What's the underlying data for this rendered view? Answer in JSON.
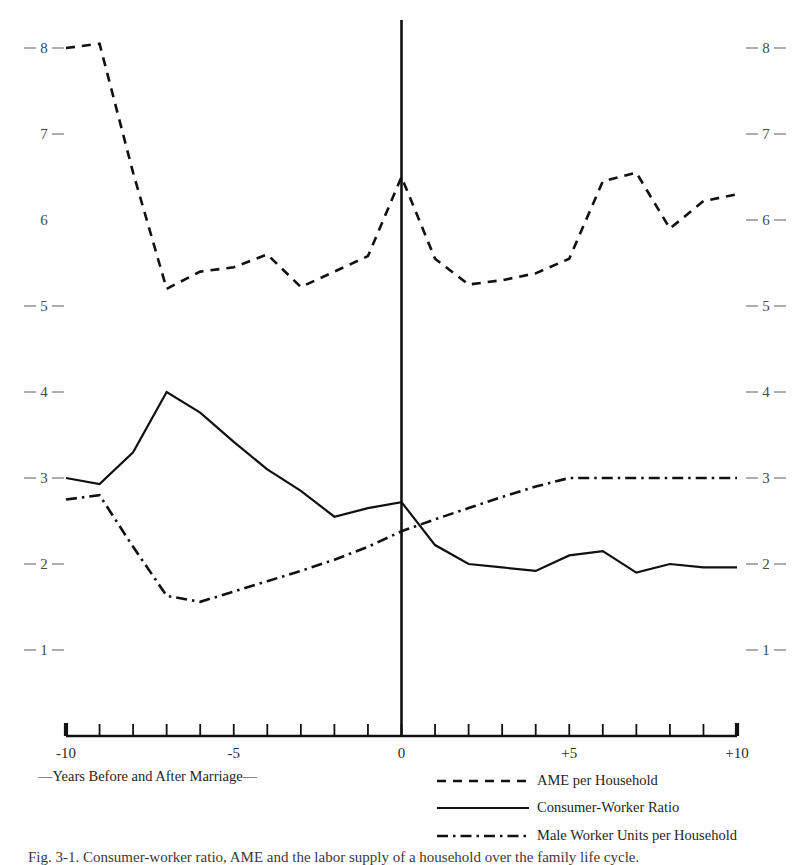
{
  "chart_data": {
    "type": "line",
    "title": "",
    "subtitle": "",
    "xlabel": "—Years Before and After Marriage—",
    "ylabel": "",
    "xlim": [
      -10,
      10
    ],
    "ylim": [
      0.55,
      8.35
    ],
    "grid": false,
    "legend_position": "bottom-right",
    "x": [
      -10,
      -9,
      -8,
      -7,
      -6,
      -5,
      -4,
      -3,
      -2,
      -1,
      0,
      1,
      2,
      3,
      4,
      5,
      6,
      7,
      8,
      9,
      10
    ],
    "x_tick_labels": [
      "-10",
      "-5",
      "0",
      "+5",
      "+10"
    ],
    "x_tick_values": [
      -10,
      -5,
      0,
      5,
      10
    ],
    "y_tick_labels": [
      "8",
      "7",
      "6",
      "5",
      "4",
      "3",
      "2",
      "1"
    ],
    "y_tick_values": [
      8,
      7,
      6,
      5,
      4,
      3,
      2,
      1
    ],
    "y_axis_both_sides": true,
    "series": [
      {
        "name": "AME per Household",
        "style": "dashed",
        "values": [
          8.0,
          8.05,
          6.55,
          5.2,
          5.4,
          5.45,
          5.6,
          5.22,
          5.4,
          5.58,
          6.5,
          5.55,
          5.25,
          5.3,
          5.38,
          5.55,
          6.45,
          6.55,
          5.9,
          6.22,
          6.3
        ]
      },
      {
        "name": "Consumer-Worker Ratio",
        "style": "solid",
        "values": [
          3.0,
          2.93,
          3.3,
          4.0,
          3.76,
          3.42,
          3.1,
          2.85,
          2.55,
          2.65,
          2.72,
          2.22,
          2.0,
          1.96,
          1.92,
          2.1,
          2.15,
          1.9,
          2.0,
          1.96,
          1.96
        ]
      },
      {
        "name": "Male Worker Units per Household",
        "style": "dash-dot",
        "values": [
          2.75,
          2.8,
          2.2,
          1.63,
          1.56,
          1.68,
          1.8,
          1.92,
          2.05,
          2.2,
          2.38,
          2.52,
          2.65,
          2.78,
          2.9,
          3.0,
          3.0,
          3.0,
          3.0,
          3.0,
          3.0
        ]
      }
    ]
  },
  "legend": {
    "items": [
      {
        "label": "AME per Household",
        "style": "dashed"
      },
      {
        "label": "Consumer-Worker Ratio",
        "style": "solid"
      },
      {
        "label": "Male Worker Units per Household",
        "style": "dash-dot"
      }
    ]
  },
  "axis": {
    "x_caption": "—Years Before and After Marriage—",
    "x_labels": {
      "left": "-10",
      "mid_left": "-5",
      "center": "0",
      "mid_right": "+5",
      "right": "+10"
    },
    "y_labels": [
      "8",
      "7",
      "6",
      "5",
      "4",
      "3",
      "2",
      "1"
    ]
  },
  "caption": {
    "text": "Fig. 3-1.  Consumer-worker ratio, AME and the labor supply of a household over the family life cycle."
  },
  "colors": {
    "ink": "#111111",
    "label": "#4a4a4a",
    "background": "#ffffff"
  }
}
